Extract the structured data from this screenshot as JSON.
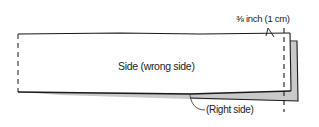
{
  "diagram": {
    "labels": {
      "seam_allowance": "⅜ inch (1 cm)",
      "wrong_side": "Side (wrong side)",
      "right_side": "(Right side)"
    },
    "colors": {
      "line": "#1a1a1a",
      "shade": "#c8c8c8",
      "background": "#ffffff"
    }
  }
}
